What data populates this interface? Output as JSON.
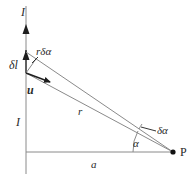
{
  "diagram": {
    "colors": {
      "line": "#8a8a8a",
      "arrow": "#1e1e1e",
      "text": "#2a2a2a",
      "point": "#111111"
    },
    "labels": {
      "current_top": "I",
      "current_mid": "I",
      "element": "δl",
      "r_dalpha": "rδα",
      "unit_vector": "u",
      "distance_r": "r",
      "perp_distance": "a",
      "angle": "α",
      "delta_angle": "δα",
      "point": "P"
    }
  }
}
